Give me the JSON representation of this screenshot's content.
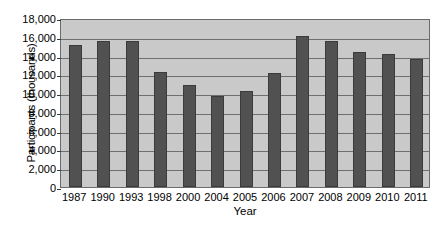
{
  "chart_data": {
    "type": "bar",
    "title": "",
    "xlabel": "Year",
    "ylabel": "Participants (thousands)",
    "categories": [
      "1987",
      "1990",
      "1993",
      "1998",
      "2000",
      "2004",
      "2005",
      "2006",
      "2007",
      "2008",
      "2009",
      "2010",
      "2011"
    ],
    "values": [
      15100,
      15500,
      15600,
      12300,
      10900,
      9700,
      10200,
      12100,
      16100,
      15500,
      14400,
      14200,
      13600
    ],
    "series": [
      {
        "name": "Participants",
        "values": [
          15100,
          15500,
          15600,
          12300,
          10900,
          9700,
          10200,
          12100,
          16100,
          15500,
          14400,
          14200,
          13600
        ]
      }
    ],
    "ylim": [
      0,
      18000
    ],
    "ytick_values": [
      0,
      2000,
      4000,
      6000,
      8000,
      10000,
      12000,
      14000,
      16000,
      18000
    ],
    "ytick_labels": [
      "0",
      "2,000",
      "4,000",
      "6,000",
      "8,000",
      "10,000",
      "12,000",
      "14,000",
      "16,000",
      "18,000"
    ],
    "grid": true,
    "grid_axis": "y",
    "legend": false,
    "legend_position": "none",
    "colors": {
      "bar_fill": "#515151",
      "bar_border": "#3b3b3b",
      "plot_background": "#c9c9c9",
      "plot_border": "#6b6b6b",
      "gridline": "#6f6f6f",
      "text": "#000000",
      "page_background": "#ffffff"
    }
  }
}
